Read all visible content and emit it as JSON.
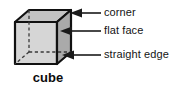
{
  "figure": {
    "title": "cube",
    "caption_label": "cube",
    "shape": "cube",
    "colors": {
      "outline": "#111111",
      "front_face": "#d6d6d6",
      "top_face": "#c2c2c2",
      "right_face": "#a9a9a9",
      "hidden_edge": "#3a3a3a",
      "leader_line": "#1a1a1a",
      "text": "#141414",
      "background": "#ffffff"
    },
    "callouts": [
      {
        "id": "corner",
        "label": "corner",
        "target": "top-right-corner-vertex",
        "arrow_direction": "left"
      },
      {
        "id": "flat-face",
        "label": "flat face",
        "target": "right-side-face",
        "arrow_direction": "left"
      },
      {
        "id": "straight-edge",
        "label": "straight edge",
        "target": "bottom-right-edge",
        "arrow_direction": "left"
      }
    ]
  }
}
